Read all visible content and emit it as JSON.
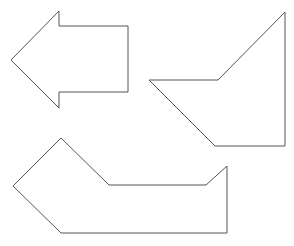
{
  "canvas": {
    "width": 294,
    "height": 246,
    "background": "#ffffff"
  },
  "style": {
    "stroke": "#555555",
    "fill": "#ffffff"
  },
  "shapes": [
    {
      "name": "left-arrow-shape",
      "points": "11,60 59,11 59,26 128,26 128,92 59,92 59,108"
    },
    {
      "name": "right-polygon-shape",
      "points": "285,12 285,146 215,146 149,80 218,80"
    },
    {
      "name": "bottom-polygon-shape",
      "points": "61,138 109,185 206,185 227,166 227,233 61,233 13,186"
    }
  ]
}
